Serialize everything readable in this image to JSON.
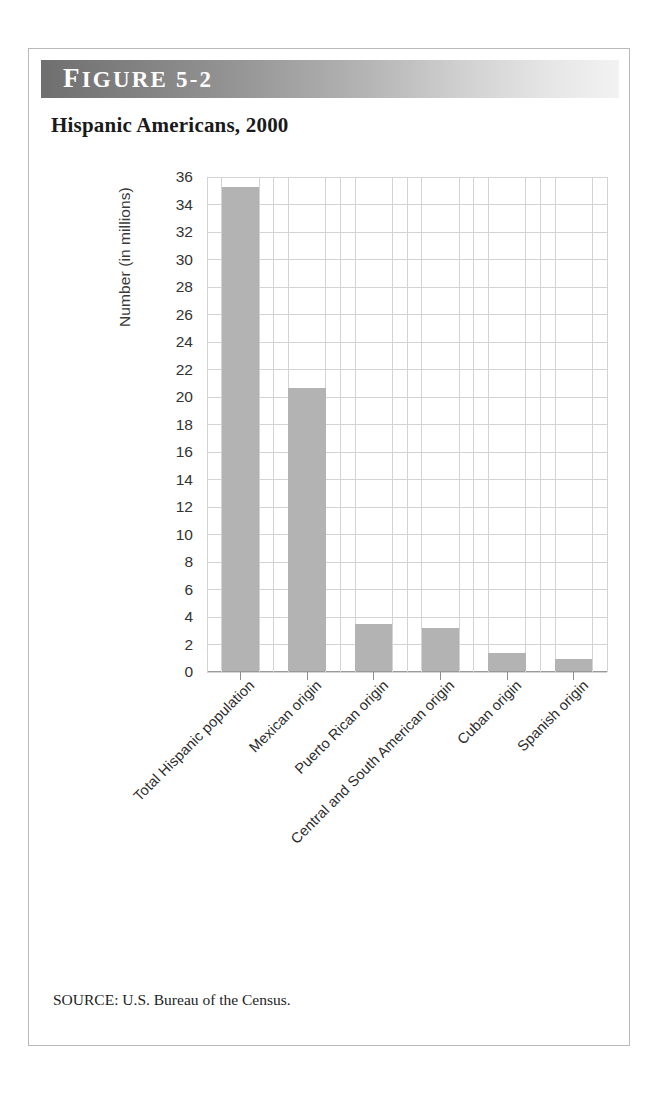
{
  "figure": {
    "header_label": "FIGURE 5-2",
    "header_label_first": "F",
    "header_label_rest": "IGURE 5-2",
    "title": "Hispanic Americans, 2000",
    "source": "SOURCE: U.S. Bureau of the Census."
  },
  "colors": {
    "bar_fill": "#b3b3b3",
    "gridline": "#d3d3d3",
    "axis": "#8c8c8c",
    "header_dark": "#6f6f6f",
    "header_light": "#f2f2f2",
    "frame_border": "#b9b9b9",
    "text": "#1a1a1a"
  },
  "chart_data": {
    "type": "bar",
    "title": "Hispanic Americans, 2000",
    "xlabel": "",
    "ylabel": "Number (in millions)",
    "ylim": [
      0,
      36
    ],
    "ytick_step": 2,
    "yticks": [
      0,
      2,
      4,
      6,
      8,
      10,
      12,
      14,
      16,
      18,
      20,
      22,
      24,
      26,
      28,
      30,
      32,
      34,
      36
    ],
    "ytick_labels": [
      "0",
      "2",
      "4",
      "6",
      "8",
      "10",
      "12",
      "14",
      "16",
      "18",
      "20",
      "22",
      "24",
      "26",
      "28",
      "30",
      "32",
      "34",
      "36"
    ],
    "grid": true,
    "grid_axes": "both",
    "legend": false,
    "categories": [
      "Total Hispanic population",
      "Mexican origin",
      "Puerto Rican origin",
      "Central and South American origin",
      "Cuban origin",
      "Spanish origin"
    ],
    "values": [
      35.2,
      20.6,
      3.4,
      3.1,
      1.3,
      0.9
    ],
    "units": "millions"
  }
}
